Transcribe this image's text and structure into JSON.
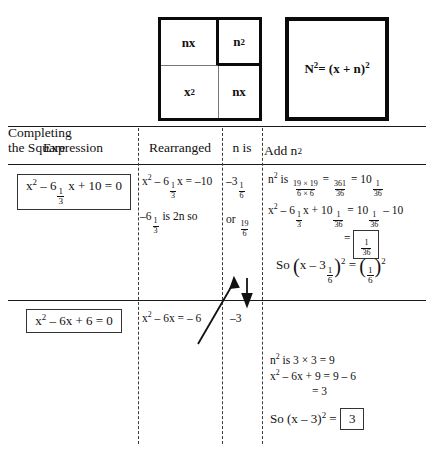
{
  "diagram": {
    "square_grid": {
      "name": "area-model-square",
      "cells": [
        {
          "label": "nx",
          "position": "top-left"
        },
        {
          "label": "n",
          "exponent": "2",
          "position": "top-right"
        },
        {
          "label": "x",
          "exponent": "2",
          "position": "bottom-left"
        },
        {
          "label": "nx",
          "position": "bottom-right"
        }
      ]
    },
    "big_square": {
      "name": "total-square",
      "formula_lhs": "N",
      "formula_lhs_exp": "2",
      "formula_rhs": "= (x + n)",
      "formula_rhs_exp": "2"
    }
  },
  "table": {
    "headers": {
      "expression": "Expression",
      "rearranged": "Rearranged",
      "n_is": "n is",
      "add_n2": "Add n",
      "add_n2_exp": "2",
      "completing_line1": "Completing",
      "completing_line2": "the Square"
    },
    "rows": [
      {
        "expression": {
          "pre": "x",
          "pre_exp": "2",
          "mid": " – 6",
          "frac_num": "1",
          "frac_den": "3",
          "post": " x + 10 = 0"
        },
        "rearranged": {
          "line1_pre": "x",
          "line1_exp": "2",
          "line1_mid": " – 6",
          "line1_frac_num": "1",
          "line1_frac_den": "3",
          "line1_post": "x = –10",
          "line2_pre": "–6",
          "line2_frac_num": "1",
          "line2_frac_den": "3",
          "line2_post": " is 2n so"
        },
        "n_is": {
          "line1_pre": "–3",
          "line1_frac_num": "1",
          "line1_frac_den": "6",
          "line2_pre": "or ",
          "line2_frac_num": "19",
          "line2_frac_den": "6"
        },
        "add_n2": {
          "line1_a": "n",
          "line1_a_exp": "2",
          "line1_b": " is ",
          "line1_f1_num": "19 × 19",
          "line1_f1_den": "6 × 6",
          "line1_c": " = ",
          "line1_f2_num": "361",
          "line1_f2_den": "36",
          "line1_d": " = 10",
          "line1_f3_num": "1",
          "line1_f3_den": "36",
          "line2_a": "x",
          "line2_a_exp": "2",
          "line2_b": " – 6",
          "line2_f1_num": "1",
          "line2_f1_den": "3",
          "line2_c": "x + 10",
          "line2_f2_num": "1",
          "line2_f2_den": "36",
          "line2_d": " = 10",
          "line2_f3_num": "1",
          "line2_f3_den": "36",
          "line2_e": " – 10",
          "line3_eq": "= ",
          "line3_f_num": "1",
          "line3_f_den": "36",
          "line4_so": "So ",
          "line4_lhs": "x – 3",
          "line4_lhs_f_num": "1",
          "line4_lhs_f_den": "6",
          "line4_lhs_exp": "2",
          "line4_eq": " = ",
          "line4_rhs_f_num": "1",
          "line4_rhs_f_den": "6",
          "line4_rhs_exp": "2"
        }
      },
      {
        "expression": {
          "pre": "x",
          "pre_exp": "2",
          "post": " – 6x + 6 = 0"
        },
        "rearranged": {
          "line1_pre": "x",
          "line1_exp": "2",
          "line1_post": " – 6x = – 6"
        },
        "n_is": {
          "line1": "–3"
        },
        "add_n2": {
          "line1_a": "n",
          "line1_a_exp": "2",
          "line1_b": " is 3 × 3 = 9",
          "line2_a": "x",
          "line2_a_exp": "2",
          "line2_b": " – 6x + 9 = 9 – 6",
          "line3": "= 3",
          "line4_so": "So  (x – 3)",
          "line4_exp": "2",
          "line4_eq": " = ",
          "line4_box": "3"
        }
      }
    ]
  },
  "colors": {
    "ink": "#111111",
    "rule": "#1a1a1a",
    "dash": "#3a3a3a",
    "background": "#ffffff"
  }
}
